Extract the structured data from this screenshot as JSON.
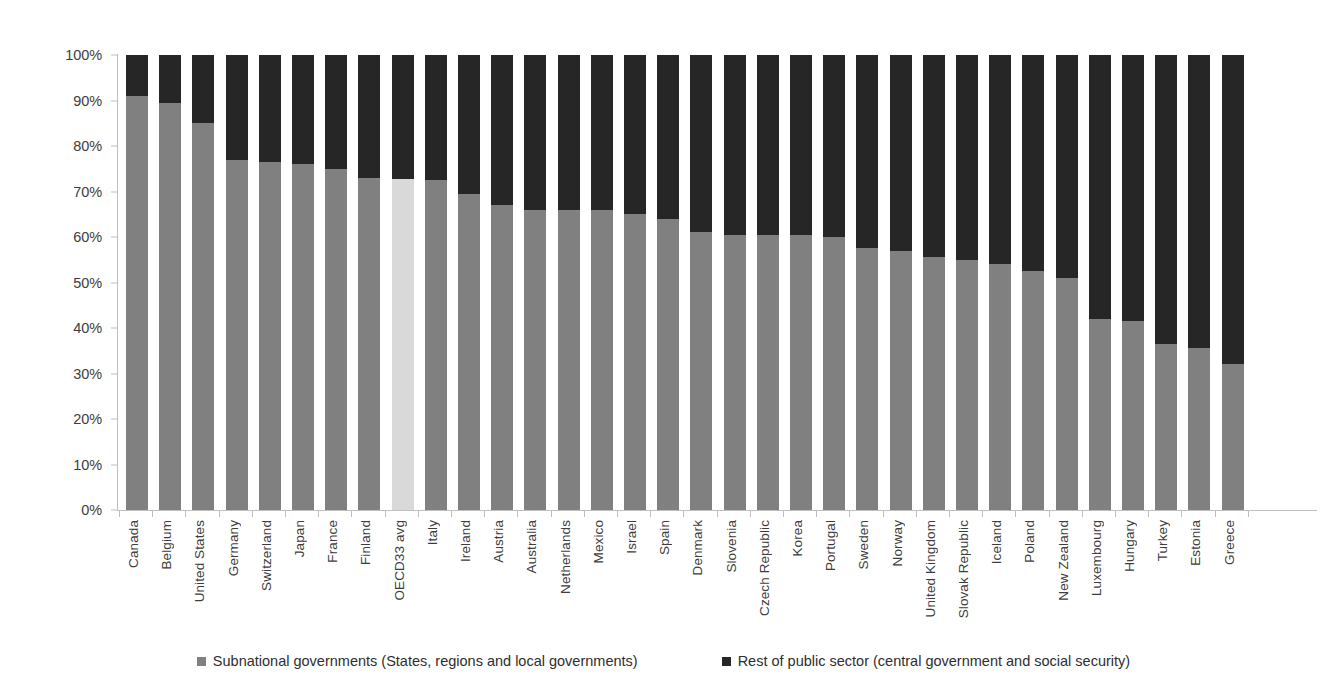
{
  "chart_data": {
    "type": "bar",
    "subtype": "stacked-100-percent-vertical",
    "title": "",
    "xlabel": "",
    "ylabel": "",
    "ylim": [
      0,
      100
    ],
    "ytick_labels": [
      "0%",
      "10%",
      "20%",
      "30%",
      "40%",
      "50%",
      "60%",
      "70%",
      "80%",
      "90%",
      "100%"
    ],
    "ytick_values": [
      0,
      10,
      20,
      30,
      40,
      50,
      60,
      70,
      80,
      90,
      100
    ],
    "grid": false,
    "legend_position": "bottom",
    "categories": [
      "Canada",
      "Belgium",
      "United States",
      "Germany",
      "Switzerland",
      "Japan",
      "France",
      "Finland",
      "OECD33 avg",
      "Italy",
      "Ireland",
      "Austria",
      "Australia",
      "Netherlands",
      "Mexico",
      "Israel",
      "Spain",
      "Denmark",
      "Slovenia",
      "Czech Republic",
      "Korea",
      "Portugal",
      "Sweden",
      "Norway",
      "United Kingdom",
      "Slovak Republic",
      "Iceland",
      "Poland",
      "New Zealand",
      "Luxembourg",
      "Hungary",
      "Turkey",
      "Estonia",
      "Greece"
    ],
    "highlight_category": "OECD33 avg",
    "series": [
      {
        "name": "Subnational governments (States, regions and local governments)",
        "color": "#808080",
        "highlight_color": "#d9d9d9",
        "values": [
          91.0,
          89.5,
          85.0,
          77.0,
          76.5,
          76.0,
          75.0,
          73.0,
          72.7,
          72.5,
          69.5,
          67.0,
          66.0,
          66.0,
          66.0,
          65.0,
          64.0,
          61.0,
          60.5,
          60.5,
          60.5,
          60.0,
          57.5,
          57.0,
          55.5,
          55.0,
          54.0,
          52.5,
          51.0,
          42.0,
          41.5,
          36.5,
          35.5,
          32.0
        ]
      },
      {
        "name": "Rest of public sector (central government and social security)",
        "color": "#262626",
        "highlight_color": "#262626",
        "values": [
          9.0,
          10.5,
          15.0,
          23.0,
          23.5,
          24.0,
          25.0,
          27.0,
          27.3,
          27.5,
          30.5,
          33.0,
          34.0,
          34.0,
          34.0,
          35.0,
          36.0,
          39.0,
          39.5,
          39.5,
          39.5,
          40.0,
          42.5,
          43.0,
          44.5,
          45.0,
          46.0,
          47.5,
          49.0,
          58.0,
          58.5,
          63.5,
          64.5,
          68.0
        ]
      }
    ]
  },
  "legend": {
    "items": [
      {
        "label": "Subnational governments (States, regions and local governments)",
        "color": "#808080"
      },
      {
        "label": "Rest of public sector (central government and social security)",
        "color": "#262626"
      }
    ]
  },
  "colors": {
    "subnational": "#808080",
    "subnational_highlight": "#d9d9d9",
    "rest_of_public_sector": "#262626",
    "axis": "#bfbfbf",
    "text": "#3d3d3d",
    "background": "#ffffff"
  }
}
